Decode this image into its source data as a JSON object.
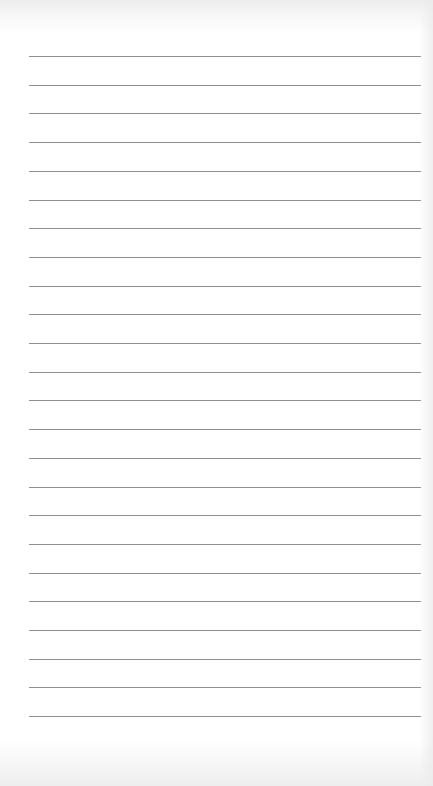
{
  "page": {
    "type": "lined-paper",
    "line_count": 24,
    "first_line_y": 56,
    "line_spacing": 28.7,
    "line_left": 29,
    "line_width": 392,
    "line_color": "#8f8f8f",
    "background_color": "#ffffff"
  }
}
